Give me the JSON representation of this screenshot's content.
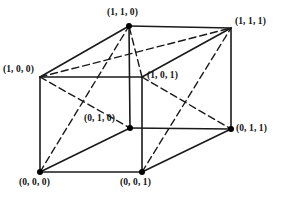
{
  "figure": {
    "name": "unit-cube-vertex-coordinates-diagram",
    "background_color": "#ffffff",
    "line_color": "#1a1a1a",
    "dash_color": "#1a1a1a",
    "dot_color": "#000000"
  },
  "geometry": {
    "solid_edge_width": 1.6,
    "dashed_edge_width": 1.4,
    "dash_pattern": "7,4",
    "dot_radius": 3.0,
    "projection": {
      "front_face": {
        "left": 40,
        "top": 77,
        "right": 142,
        "bottom": 172
      },
      "depth_offset_x": 89,
      "depth_offset_y": -49
    }
  },
  "vertices": [
    {
      "id": "v-1-0-0",
      "label": "(1, 0, 0)",
      "x": 40,
      "y": 77,
      "has_dot": false,
      "label_x": 3,
      "label_y": 65,
      "label_anchor": "left-above"
    },
    {
      "id": "v-0-0-0",
      "label": "(0, 0, 0)",
      "x": 40,
      "y": 172,
      "has_dot": true,
      "label_x": 19,
      "label_y": 178,
      "label_anchor": "below-left"
    },
    {
      "id": "v-1-0-1",
      "label": "(1, 0, 1)",
      "x": 142,
      "y": 77,
      "has_dot": false,
      "label_x": 147,
      "label_y": 71,
      "label_anchor": "right"
    },
    {
      "id": "v-0-0-1",
      "label": "(0, 0, 1)",
      "x": 142,
      "y": 172,
      "has_dot": true,
      "label_x": 120,
      "label_y": 178,
      "label_anchor": "below"
    },
    {
      "id": "v-1-1-0",
      "label": "(1, 1, 0)",
      "x": 129,
      "y": 26,
      "has_dot": true,
      "label_x": 107,
      "label_y": 8,
      "label_anchor": "above"
    },
    {
      "id": "v-0-1-0",
      "label": "(0, 1, 0)",
      "x": 130,
      "y": 128,
      "has_dot": true,
      "label_x": 84,
      "label_y": 114,
      "label_anchor": "left-above"
    },
    {
      "id": "v-1-1-1",
      "label": "(1, 1, 1)",
      "x": 231,
      "y": 28,
      "has_dot": false,
      "label_x": 235,
      "label_y": 17,
      "label_anchor": "right-above"
    },
    {
      "id": "v-0-1-1",
      "label": "(0, 1, 1)",
      "x": 231,
      "y": 129,
      "has_dot": true,
      "label_x": 236,
      "label_y": 124,
      "label_anchor": "right"
    }
  ],
  "solid_edges": [
    {
      "name": "edge-front-left",
      "from": "v-1-0-0",
      "to": "v-0-0-0"
    },
    {
      "name": "edge-front-top",
      "from": "v-1-0-0",
      "to": "v-1-0-1"
    },
    {
      "name": "edge-front-right",
      "from": "v-1-0-1",
      "to": "v-0-0-1"
    },
    {
      "name": "edge-front-bottom",
      "from": "v-0-0-0",
      "to": "v-0-0-1"
    },
    {
      "name": "edge-back-top",
      "from": "v-1-1-0",
      "to": "v-1-1-1"
    },
    {
      "name": "edge-back-right",
      "from": "v-1-1-1",
      "to": "v-0-1-1"
    },
    {
      "name": "edge-back-bottom",
      "from": "v-0-1-0",
      "to": "v-0-1-1"
    },
    {
      "name": "edge-back-left",
      "from": "v-1-1-0",
      "to": "v-0-1-0"
    },
    {
      "name": "edge-depth-top-left",
      "from": "v-1-0-0",
      "to": "v-1-1-0"
    },
    {
      "name": "edge-depth-top-right",
      "from": "v-1-0-1",
      "to": "v-1-1-1"
    },
    {
      "name": "edge-depth-bottom-left",
      "from": "v-0-0-0",
      "to": "v-0-1-0"
    },
    {
      "name": "edge-depth-bottom-right",
      "from": "v-0-0-1",
      "to": "v-0-1-1"
    }
  ],
  "dashed_diagonals": [
    {
      "name": "diagonal-top-face-a",
      "from": "v-1-0-0",
      "to": "v-1-1-1"
    },
    {
      "name": "diagonal-top-face-b",
      "from": "v-1-0-1",
      "to": "v-1-1-0"
    },
    {
      "name": "diagonal-left-face-a",
      "from": "v-1-0-0",
      "to": "v-0-1-0"
    },
    {
      "name": "diagonal-left-face-b",
      "from": "v-0-0-0",
      "to": "v-1-1-0"
    },
    {
      "name": "diagonal-right-face-a",
      "from": "v-1-0-1",
      "to": "v-0-1-1"
    },
    {
      "name": "diagonal-right-face-b",
      "from": "v-0-0-1",
      "to": "v-1-1-1"
    }
  ]
}
